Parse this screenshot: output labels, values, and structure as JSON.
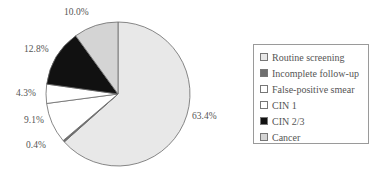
{
  "chart_data": {
    "type": "pie",
    "title": "",
    "start_angle": "12 o'clock",
    "direction": "clockwise",
    "categories": [
      "Routine screening",
      "Incomplete follow-up",
      "False-positive smear",
      "CIN 1",
      "CIN 2/3",
      "Cancer"
    ],
    "values": [
      63.4,
      0.4,
      9.1,
      4.3,
      12.8,
      10.0
    ],
    "labels": [
      "63.4%",
      "0.4%",
      "9.1%",
      "4.3%",
      "12.8%",
      "10.0%"
    ],
    "colors": [
      "#e8e8e8",
      "#6f6f6f",
      "#ffffff",
      "#ffffff",
      "#111111",
      "#d4d4d4"
    ],
    "legend_position": "right"
  },
  "legend": {
    "items": [
      {
        "label": "Routine screening",
        "color": "#e8e8e8"
      },
      {
        "label": "Incomplete follow-up",
        "color": "#6f6f6f"
      },
      {
        "label": "False-positive smear",
        "color": "#ffffff"
      },
      {
        "label": "CIN 1",
        "color": "#ffffff"
      },
      {
        "label": "CIN 2/3",
        "color": "#111111"
      },
      {
        "label": "Cancer",
        "color": "#d4d4d4"
      }
    ]
  },
  "slice_labels": [
    {
      "text": "63.4%",
      "x": 192,
      "y": 117
    },
    {
      "text": "0.4%",
      "x": 26,
      "y": 146
    },
    {
      "text": "9.1%",
      "x": 24,
      "y": 121
    },
    {
      "text": "4.3%",
      "x": 16,
      "y": 88
    },
    {
      "text": "12.8%",
      "x": 24,
      "y": 44
    },
    {
      "text": "10.0%",
      "x": 64,
      "y": 8
    }
  ]
}
